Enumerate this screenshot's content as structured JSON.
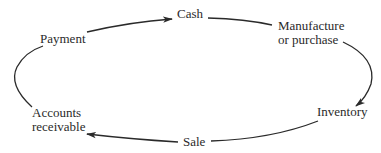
{
  "diagram": {
    "type": "cycle",
    "nodes": {
      "cash": "Cash",
      "manufacture_line1": "Manufacture",
      "manufacture_line2": "or purchase",
      "inventory": "Inventory",
      "sale": "Sale",
      "receivable_line1": "Accounts",
      "receivable_line2": "receivable",
      "payment": "Payment"
    },
    "edges": [
      {
        "from": "Payment",
        "to": "Cash",
        "arrowhead": true
      },
      {
        "from": "Cash",
        "to": "Manufacture or purchase",
        "arrowhead": false
      },
      {
        "from": "Manufacture or purchase",
        "to": "Inventory",
        "arrowhead": true
      },
      {
        "from": "Inventory",
        "to": "Sale",
        "arrowhead": false
      },
      {
        "from": "Sale",
        "to": "Accounts receivable",
        "arrowhead": true
      },
      {
        "from": "Accounts receivable",
        "to": "Payment",
        "arrowhead": false
      }
    ],
    "colors": {
      "line": "#2a2a2a",
      "text": "#2a2a2a",
      "background": "#ffffff"
    }
  }
}
